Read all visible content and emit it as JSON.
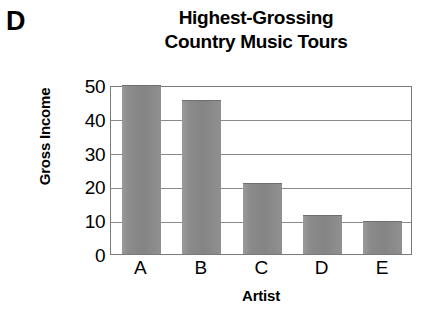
{
  "figure": {
    "panel_label": "D",
    "title_line1": "Highest-Grossing",
    "title_line2": "Country Music Tours"
  },
  "chart_data": {
    "type": "bar",
    "title": "Highest-Grossing Country Music Tours",
    "categories": [
      "A",
      "B",
      "C",
      "D",
      "E"
    ],
    "values": [
      50,
      45.5,
      21,
      11.5,
      9.7
    ],
    "xlabel": "Artist",
    "ylabel": "Gross Income",
    "ylim": [
      0,
      50
    ],
    "yticks": [
      0,
      10,
      20,
      30,
      40,
      50
    ],
    "ytick_labels": [
      "0",
      "10",
      "20",
      "30",
      "40",
      "50"
    ],
    "grid": true,
    "grid_axis": "y",
    "legend": false,
    "bar_color": "#8b8b8b",
    "axis_color": "#7a7a7a",
    "grid_color": "#8a8a8a"
  }
}
